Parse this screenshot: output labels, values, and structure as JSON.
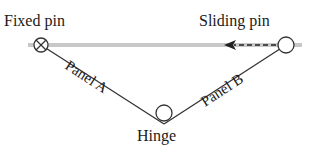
{
  "diagram": {
    "labels": {
      "fixed_pin": "Fixed pin",
      "sliding_pin": "Sliding pin",
      "panel_a": "Panel A",
      "panel_b": "Panel B",
      "hinge": "Hinge"
    },
    "icons": {
      "fixed_pin": "circle-with-cross",
      "sliding_pin": "open-circle",
      "hinge": "open-circle",
      "motion_arrow": "dashed-arrow-left"
    },
    "colors": {
      "rail": "#c8c8c8",
      "line": "#333333",
      "text": "#1a1a1a",
      "background": "#ffffff"
    }
  }
}
